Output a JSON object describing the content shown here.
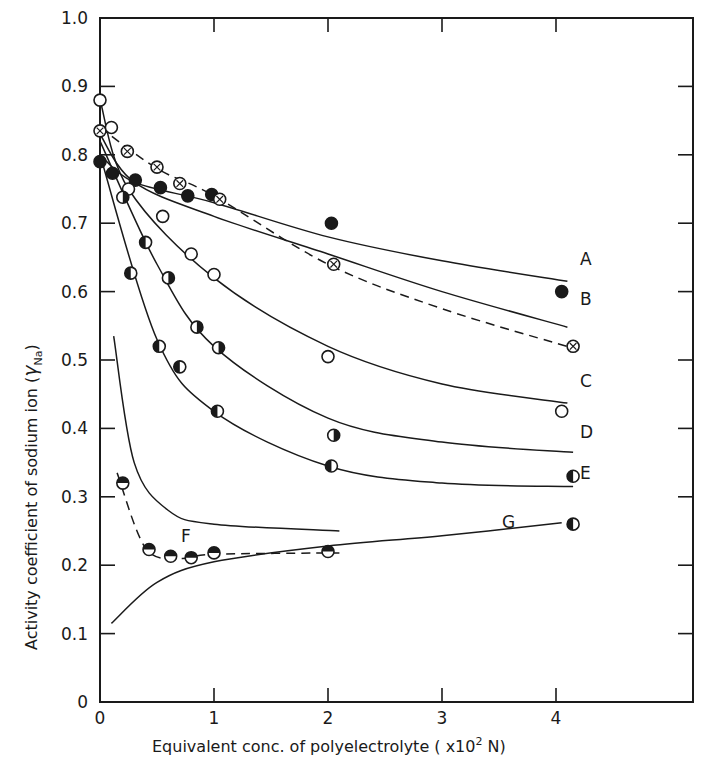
{
  "chart_data": {
    "type": "scatter",
    "title": "",
    "xlabel": "Equivalent conc. of polyelectrolyte (x10^2 N)",
    "ylabel": "Activity coefficient of sodium ion (γNa)",
    "xlim": [
      0,
      4.3
    ],
    "ylim": [
      0,
      1.0
    ],
    "x_ticks": [
      "0",
      "1",
      "2",
      "3",
      "4"
    ],
    "y_ticks": [
      "0",
      "0.1",
      "0.2",
      "0.3",
      "0.4",
      "0.5",
      "0.6",
      "0.7",
      "0.8",
      "0.9",
      "1.0"
    ],
    "grid": false,
    "legend": "curves labeled directly A–G at right",
    "series": [
      {
        "name": "A",
        "marker": "filled",
        "line": "solid",
        "points": [
          [
            0,
            0.79
          ],
          [
            0.11,
            0.773
          ],
          [
            0.31,
            0.763
          ],
          [
            0.53,
            0.752
          ],
          [
            0.77,
            0.74
          ],
          [
            0.98,
            0.742
          ],
          [
            2.03,
            0.7
          ],
          [
            4.05,
            0.6
          ]
        ],
        "curve": [
          [
            0,
            0.8
          ],
          [
            0.3,
            0.76
          ],
          [
            1,
            0.73
          ],
          [
            2,
            0.68
          ],
          [
            3,
            0.645
          ],
          [
            4.1,
            0.615
          ]
        ]
      },
      {
        "name": "B",
        "marker": "crossed-circle",
        "line": "dashed",
        "points": [
          [
            0,
            0.835
          ],
          [
            0.24,
            0.805
          ],
          [
            0.5,
            0.782
          ],
          [
            0.7,
            0.758
          ],
          [
            1.05,
            0.735
          ],
          [
            2.05,
            0.64
          ],
          [
            4.15,
            0.52
          ]
        ],
        "curve": [
          [
            0,
            0.84
          ],
          [
            0.5,
            0.78
          ],
          [
            1,
            0.74
          ],
          [
            2,
            0.64
          ],
          [
            3,
            0.575
          ],
          [
            4.2,
            0.515
          ]
        ]
      },
      {
        "name": "B (solid)",
        "marker": "none",
        "line": "solid",
        "curve": [
          [
            0,
            0.83
          ],
          [
            0.3,
            0.76
          ],
          [
            1,
            0.71
          ],
          [
            2,
            0.655
          ],
          [
            3,
            0.6
          ],
          [
            4.1,
            0.548
          ]
        ]
      },
      {
        "name": "C",
        "marker": "open",
        "line": "solid",
        "points": [
          [
            0,
            0.88
          ],
          [
            0.1,
            0.84
          ],
          [
            0.25,
            0.75
          ],
          [
            0.55,
            0.71
          ],
          [
            0.8,
            0.655
          ],
          [
            1.0,
            0.625
          ],
          [
            2.0,
            0.505
          ],
          [
            4.05,
            0.425
          ]
        ],
        "curve": [
          [
            0,
            0.88
          ],
          [
            0.25,
            0.75
          ],
          [
            1,
            0.62
          ],
          [
            2,
            0.52
          ],
          [
            3,
            0.465
          ],
          [
            4.1,
            0.437
          ]
        ]
      },
      {
        "name": "D",
        "marker": "half-filled-right",
        "line": "solid",
        "points": [
          [
            0.2,
            0.738
          ],
          [
            0.6,
            0.62
          ],
          [
            0.85,
            0.548
          ],
          [
            1.04,
            0.518
          ],
          [
            2.05,
            0.39
          ]
        ],
        "curve": [
          [
            0,
            0.82
          ],
          [
            0.5,
            0.64
          ],
          [
            1,
            0.52
          ],
          [
            2,
            0.415
          ],
          [
            3,
            0.38
          ],
          [
            4.15,
            0.365
          ]
        ]
      },
      {
        "name": "E",
        "marker": "half-filled-left",
        "line": "solid",
        "points": [
          [
            0.27,
            0.627
          ],
          [
            0.4,
            0.672
          ],
          [
            0.52,
            0.52
          ],
          [
            0.7,
            0.49
          ],
          [
            1.03,
            0.425
          ],
          [
            2.03,
            0.345
          ],
          [
            4.15,
            0.33
          ]
        ],
        "curve": [
          [
            0,
            0.8
          ],
          [
            0.5,
            0.53
          ],
          [
            1,
            0.425
          ],
          [
            2,
            0.345
          ],
          [
            3,
            0.32
          ],
          [
            4.15,
            0.315
          ]
        ]
      },
      {
        "name": "F",
        "marker": "half-filled-top",
        "line": "dashed",
        "points": [
          [
            0.2,
            0.32
          ],
          [
            0.43,
            0.223
          ],
          [
            0.62,
            0.213
          ],
          [
            0.8,
            0.211
          ],
          [
            1.0,
            0.218
          ],
          [
            2.0,
            0.22
          ]
        ],
        "curve": [
          [
            0.15,
            0.335
          ],
          [
            0.4,
            0.225
          ],
          [
            0.7,
            0.21
          ],
          [
            1,
            0.216
          ],
          [
            2.1,
            0.218
          ]
        ]
      },
      {
        "name": "F (upper solid)",
        "marker": "none",
        "line": "solid",
        "curve": [
          [
            0.12,
            0.535
          ],
          [
            0.3,
            0.35
          ],
          [
            0.6,
            0.28
          ],
          [
            1,
            0.26
          ],
          [
            2.1,
            0.25
          ]
        ]
      },
      {
        "name": "G",
        "marker": "half-filled-left",
        "line": "solid",
        "points": [
          [
            4.15,
            0.26
          ]
        ],
        "curve": [
          [
            0.1,
            0.115
          ],
          [
            0.5,
            0.175
          ],
          [
            1,
            0.205
          ],
          [
            2,
            0.228
          ],
          [
            3,
            0.243
          ],
          [
            4.05,
            0.262
          ]
        ]
      }
    ]
  },
  "labels": {
    "xlabel": "Equivalent conc. of polyelectrolyte ( x10",
    "xlabel_sup": "2",
    "xlabel_end": " N)",
    "ylabel": "Activity coefficient of sodium ion (",
    "ylabel_gamma": "γ",
    "ylabel_sub": "Na",
    "ylabel_end": ")",
    "series_A": "A",
    "series_B": "B",
    "series_C": "C",
    "series_D": "D",
    "series_E": "E",
    "series_F": "F",
    "series_G": "G"
  }
}
